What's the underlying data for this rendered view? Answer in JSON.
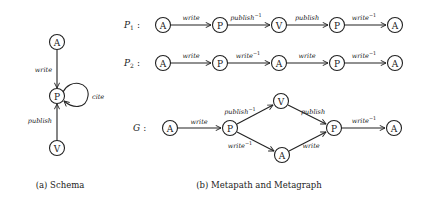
{
  "schema": {
    "caption": "(a) Schema",
    "nodes": [
      {
        "id": "A",
        "label": "A"
      },
      {
        "id": "P",
        "label": "P"
      },
      {
        "id": "V",
        "label": "V"
      }
    ],
    "edges": [
      {
        "from": "A",
        "to": "P",
        "label": "write"
      },
      {
        "from": "P",
        "to": "P",
        "label": "cite"
      },
      {
        "from": "V",
        "to": "P",
        "label": "publish"
      }
    ]
  },
  "metapaths": {
    "caption": "(b) Metapath and Metagraph",
    "p1": {
      "name": "P",
      "subscript": "1",
      "colon": ":",
      "nodes": [
        "A",
        "P",
        "V",
        "P",
        "A"
      ],
      "edges": [
        {
          "label": "write",
          "sup": ""
        },
        {
          "label": "publish",
          "sup": "−1"
        },
        {
          "label": "publish",
          "sup": ""
        },
        {
          "label": "write",
          "sup": "−1"
        }
      ]
    },
    "p2": {
      "name": "P",
      "subscript": "2",
      "colon": ":",
      "nodes": [
        "A",
        "P",
        "A",
        "P",
        "A"
      ],
      "edges": [
        {
          "label": "write",
          "sup": ""
        },
        {
          "label": "write",
          "sup": "−1"
        },
        {
          "label": "write",
          "sup": ""
        },
        {
          "label": "write",
          "sup": "−1"
        }
      ]
    },
    "metagraph": {
      "name": "G",
      "colon": ":",
      "nodes": {
        "a1": "A",
        "p1": "P",
        "v": "V",
        "a_mid": "A",
        "p2": "P",
        "a2": "A"
      },
      "edges": {
        "a1_p1": {
          "label": "write",
          "sup": ""
        },
        "p1_v": {
          "label": "publish",
          "sup": "−1"
        },
        "p1_amid": {
          "label": "write",
          "sup": "−1"
        },
        "v_p2": {
          "label": "publish",
          "sup": ""
        },
        "amid_p2": {
          "label": "write",
          "sup": ""
        },
        "p2_a2": {
          "label": "write",
          "sup": "−1"
        }
      }
    }
  }
}
